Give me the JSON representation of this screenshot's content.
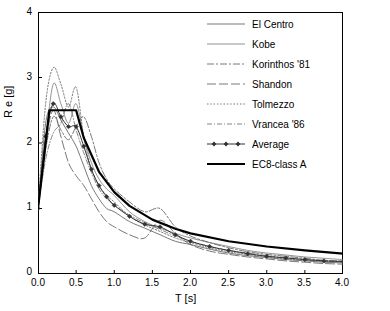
{
  "chart_data": {
    "type": "line",
    "title": "",
    "xlabel": "T [s]",
    "ylabel": "R e  [g]",
    "xlim": [
      0,
      4
    ],
    "ylim": [
      0,
      4
    ],
    "xticks": [
      "0.0",
      "0.5",
      "1.0",
      "1.5",
      "2.0",
      "2.5",
      "3.0",
      "3.5",
      "4.0"
    ],
    "yticks": [
      "0",
      "1",
      "2",
      "3",
      "4"
    ],
    "grid": false,
    "legend_position": "top-right",
    "series": [
      {
        "name": "El Centro",
        "style": "thin-solid",
        "color": "#555555",
        "x": [
          0.0,
          0.1,
          0.2,
          0.3,
          0.4,
          0.5,
          0.6,
          0.7,
          0.8,
          0.9,
          1.0,
          1.2,
          1.4,
          1.6,
          1.8,
          2.0,
          2.25,
          2.5,
          2.75,
          3.0,
          3.25,
          3.5,
          3.75,
          4.0
        ],
        "values": [
          1.0,
          2.3,
          2.55,
          2.35,
          2.15,
          1.95,
          1.65,
          1.35,
          1.15,
          1.0,
          0.95,
          0.8,
          0.7,
          0.6,
          0.5,
          0.45,
          0.38,
          0.32,
          0.28,
          0.25,
          0.22,
          0.2,
          0.18,
          0.17
        ]
      },
      {
        "name": "Kobe",
        "style": "thin-solid-2",
        "color": "#666666",
        "x": [
          0.0,
          0.1,
          0.2,
          0.3,
          0.4,
          0.5,
          0.6,
          0.7,
          0.8,
          0.9,
          1.0,
          1.2,
          1.4,
          1.6,
          1.8,
          2.0,
          2.25,
          2.5,
          2.75,
          3.0,
          3.25,
          3.5,
          3.75,
          4.0
        ],
        "values": [
          1.0,
          2.05,
          2.9,
          2.6,
          2.3,
          2.6,
          2.1,
          1.7,
          1.45,
          1.3,
          1.2,
          0.95,
          0.8,
          0.7,
          0.62,
          0.55,
          0.48,
          0.42,
          0.36,
          0.32,
          0.29,
          0.26,
          0.24,
          0.22
        ]
      },
      {
        "name": "Korinthos '81",
        "style": "dash-dot",
        "color": "#555555",
        "x": [
          0.0,
          0.1,
          0.2,
          0.3,
          0.4,
          0.5,
          0.6,
          0.7,
          0.8,
          0.9,
          1.0,
          1.2,
          1.4,
          1.6,
          1.8,
          2.0,
          2.25,
          2.5,
          2.75,
          3.0,
          3.25,
          3.5,
          3.75,
          4.0
        ],
        "values": [
          1.0,
          1.9,
          2.4,
          2.2,
          2.05,
          2.25,
          2.4,
          2.1,
          1.7,
          1.45,
          1.3,
          1.1,
          0.95,
          1.0,
          0.72,
          0.58,
          0.48,
          0.4,
          0.34,
          0.3,
          0.27,
          0.24,
          0.21,
          0.2
        ]
      },
      {
        "name": "Shandon",
        "style": "long-dash",
        "color": "#555555",
        "x": [
          0.0,
          0.1,
          0.2,
          0.3,
          0.4,
          0.5,
          0.6,
          0.7,
          0.8,
          0.9,
          1.0,
          1.2,
          1.4,
          1.6,
          1.8,
          2.0,
          2.25,
          2.5,
          2.75,
          3.0,
          3.25,
          3.5,
          3.75,
          4.0
        ],
        "values": [
          1.0,
          2.0,
          2.5,
          2.1,
          1.7,
          1.5,
          1.35,
          1.15,
          0.95,
          0.8,
          0.72,
          0.6,
          0.55,
          0.82,
          0.62,
          0.45,
          0.35,
          0.3,
          0.26,
          0.23,
          0.2,
          0.18,
          0.16,
          0.15
        ]
      },
      {
        "name": "Tolmezzo",
        "style": "dotted",
        "color": "#777777",
        "x": [
          0.0,
          0.1,
          0.2,
          0.3,
          0.4,
          0.5,
          0.6,
          0.7,
          0.8,
          0.9,
          1.0,
          1.2,
          1.4,
          1.6,
          1.8,
          2.0,
          2.25,
          2.5,
          2.75,
          3.0,
          3.25,
          3.5,
          3.75,
          4.0
        ],
        "values": [
          1.0,
          2.6,
          3.15,
          2.9,
          2.55,
          2.85,
          2.1,
          1.6,
          1.35,
          1.2,
          1.1,
          0.88,
          0.75,
          0.65,
          0.55,
          0.48,
          0.4,
          0.34,
          0.3,
          0.26,
          0.23,
          0.21,
          0.19,
          0.18
        ]
      },
      {
        "name": "Vrancea '86",
        "style": "dash-dot-2",
        "color": "#666666",
        "x": [
          0.0,
          0.1,
          0.2,
          0.3,
          0.4,
          0.5,
          0.6,
          0.7,
          0.8,
          0.9,
          1.0,
          1.2,
          1.4,
          1.6,
          1.8,
          2.0,
          2.25,
          2.5,
          2.75,
          3.0,
          3.25,
          3.5,
          3.75,
          4.0
        ],
        "values": [
          1.0,
          1.75,
          2.15,
          2.3,
          2.6,
          2.2,
          1.85,
          1.55,
          1.3,
          1.15,
          1.05,
          0.9,
          0.78,
          0.68,
          0.58,
          0.5,
          0.42,
          0.36,
          0.32,
          0.28,
          0.25,
          0.22,
          0.2,
          0.19
        ]
      },
      {
        "name": "Average",
        "style": "marker-line",
        "color": "#333333",
        "x": [
          0.0,
          0.1,
          0.2,
          0.3,
          0.4,
          0.5,
          0.6,
          0.7,
          0.8,
          0.9,
          1.0,
          1.2,
          1.4,
          1.6,
          1.8,
          2.0,
          2.25,
          2.5,
          2.75,
          3.0,
          3.25,
          3.5,
          3.75,
          4.0
        ],
        "values": [
          1.0,
          2.1,
          2.6,
          2.4,
          2.25,
          2.25,
          1.95,
          1.6,
          1.35,
          1.18,
          1.05,
          0.88,
          0.76,
          0.72,
          0.6,
          0.5,
          0.42,
          0.36,
          0.31,
          0.27,
          0.245,
          0.22,
          0.2,
          0.19
        ]
      },
      {
        "name": "EC8-class A",
        "style": "thick-solid",
        "color": "#000000",
        "x": [
          0.0,
          0.15,
          0.5,
          0.6,
          0.8,
          1.0,
          1.2,
          1.5,
          1.8,
          2.0,
          2.5,
          3.0,
          3.5,
          4.0
        ],
        "values": [
          1.0,
          2.5,
          2.5,
          2.08,
          1.56,
          1.25,
          1.04,
          0.83,
          0.69,
          0.62,
          0.5,
          0.42,
          0.36,
          0.31
        ]
      }
    ]
  },
  "legend": {
    "items": [
      {
        "label": "El Centro",
        "key": "thin-solid"
      },
      {
        "label": "Kobe",
        "key": "thin-solid-2"
      },
      {
        "label": "Korinthos '81",
        "key": "dash-dot"
      },
      {
        "label": "Shandon",
        "key": "long-dash"
      },
      {
        "label": "Tolmezzo",
        "key": "dotted"
      },
      {
        "label": "Vrancea '86",
        "key": "dash-dot-2"
      },
      {
        "label": "Average",
        "key": "marker-line"
      },
      {
        "label": "EC8-class A",
        "key": "thick-solid"
      }
    ]
  }
}
